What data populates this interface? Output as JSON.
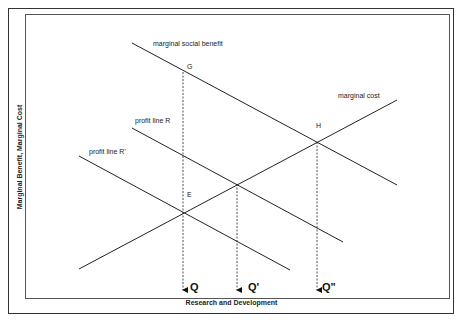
{
  "diagram": {
    "x_axis_label": "Research and Development",
    "y_axis_label": "Marginal Benefit, Marginal Cost",
    "curves": [
      {
        "name": "marginal social benefit",
        "label": "marginal social benefit"
      },
      {
        "name": "marginal cost",
        "label": "marginal cost"
      },
      {
        "name": "profit line R",
        "label": "profit line R"
      },
      {
        "name": "profit line R'",
        "label": "profit line R'"
      }
    ],
    "points": {
      "G": "G",
      "E": "E",
      "H": "H"
    },
    "quantities": {
      "q": "Q",
      "q_prime": "Q'",
      "q_double_prime": "Q\""
    }
  }
}
